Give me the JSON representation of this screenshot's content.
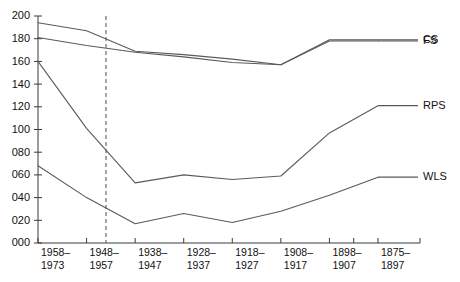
{
  "chart_data": {
    "type": "line",
    "title": "",
    "subtitle": "",
    "xlabel": "",
    "ylabel": "",
    "ylim": [
      0,
      200
    ],
    "ytick_labels": [
      "000",
      "020",
      "040",
      "060",
      "080",
      "100",
      "120",
      "140",
      "160",
      "180",
      "200"
    ],
    "ytick_values": [
      0,
      20,
      40,
      60,
      80,
      100,
      120,
      140,
      160,
      180,
      200
    ],
    "grid": false,
    "legend_position": "right-inline",
    "categories": [
      "1958–1973",
      "1948–1957",
      "1938–1947",
      "1928–1937",
      "1918–1927",
      "1908–1917",
      "1898–1907",
      "1875–1897"
    ],
    "xtick_labels_line1": [
      "1958–",
      "1948–",
      "1938–",
      "1928–",
      "1918–",
      "1908–",
      "1898–",
      "1875–"
    ],
    "xtick_labels_line2": [
      "1973",
      "1957",
      "1947",
      "1937",
      "1927",
      "1917",
      "1907",
      "1897"
    ],
    "unlabeled_tick_count": 1,
    "annotations": [
      {
        "name": "reference-line",
        "type": "vertical-dashed",
        "at_category": "1948–1957"
      }
    ],
    "series": [
      {
        "name": "CS",
        "values": [
          194,
          187,
          169,
          166,
          162,
          157,
          179,
          179
        ]
      },
      {
        "name": "FS",
        "values": [
          181,
          174,
          168,
          164,
          159,
          157,
          178,
          178
        ]
      },
      {
        "name": "RPS",
        "values": [
          160,
          101,
          53,
          60,
          56,
          59,
          97,
          121
        ]
      },
      {
        "name": "WLS",
        "values": [
          68,
          40,
          17,
          26,
          18,
          28,
          42,
          58
        ]
      }
    ]
  }
}
